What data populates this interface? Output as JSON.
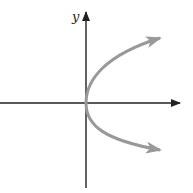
{
  "diagram": {
    "title": "",
    "axes": {
      "y_label": "y",
      "x_label": "",
      "axis_color": "#222222"
    },
    "curve": {
      "description": "sideways parabola opening right, vertex at origin",
      "color": "#999999"
    }
  }
}
